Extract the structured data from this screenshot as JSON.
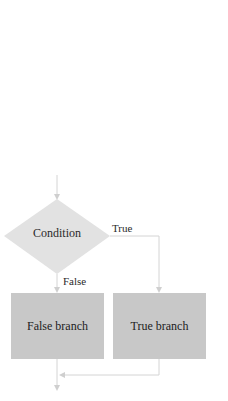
{
  "diagram": {
    "type": "flowchart",
    "nodes": {
      "condition": {
        "label": "Condition",
        "shape": "diamond",
        "color": "#e2e2e2"
      },
      "false_branch": {
        "label": "False branch",
        "shape": "rectangle",
        "color": "#c8c8c8"
      },
      "true_branch": {
        "label": "True branch",
        "shape": "rectangle",
        "color": "#c8c8c8"
      }
    },
    "edges": {
      "true": {
        "label": "True",
        "from": "condition",
        "to": "true_branch"
      },
      "false": {
        "label": "False",
        "from": "condition",
        "to": "false_branch"
      },
      "merge": {
        "from": "true_branch",
        "to": "false_branch_exit"
      }
    },
    "line_color": "#d4d4d4"
  }
}
